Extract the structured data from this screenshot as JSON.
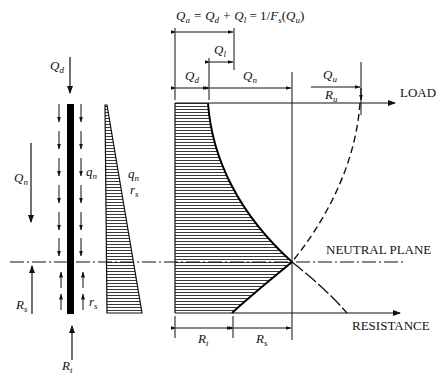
{
  "title_equation": {
    "Qa": "Q",
    "Qa_sub": "a",
    "eq": "= ",
    "Qd": "Q",
    "Qd_sub": "d",
    "plus": " + ",
    "Ql": "Q",
    "Ql_sub": "l",
    "rest": " = 1/F",
    "Fs_sub": "s",
    "paren_open": "(",
    "Qu": "Q",
    "Qu_sub": "u",
    "paren_close": ")"
  },
  "labels": {
    "Qd_top": {
      "main": "Q",
      "sub": "d"
    },
    "Qn_left": {
      "main": "Q",
      "sub": "n"
    },
    "qn_pile": {
      "main": "q",
      "sub": "n"
    },
    "rs_pile": {
      "main": "r",
      "sub": "s"
    },
    "qn_tri": {
      "main": "q",
      "sub": "n"
    },
    "rs_tri": {
      "main": "r",
      "sub": "s"
    },
    "Rs_left": {
      "main": "R",
      "sub": "s"
    },
    "Rt_bottom": {
      "main": "R",
      "sub": "t"
    },
    "Ql_dim": {
      "main": "Q",
      "sub": "l"
    },
    "Qd_dim": {
      "main": "Q",
      "sub": "d"
    },
    "Qn_dim": {
      "main": "Q",
      "sub": "n"
    },
    "Qu_dim": {
      "main": "Q",
      "sub": "u"
    },
    "Ru_dim": {
      "main": "R",
      "sub": "u"
    },
    "Rt_dim": {
      "main": "R",
      "sub": "t"
    },
    "Rs_dim": {
      "main": "R",
      "sub": "s"
    }
  },
  "captions": {
    "load": "LOAD",
    "neutral_plane": "NEUTRAL PLANE",
    "resistance": "RESISTANCE"
  }
}
